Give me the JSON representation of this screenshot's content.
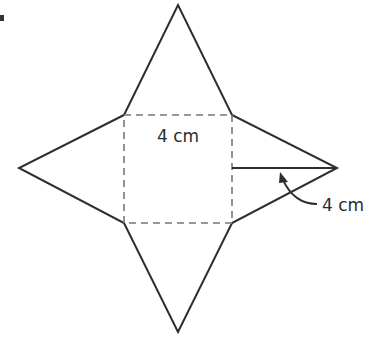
{
  "diagram": {
    "marker": "bullet",
    "base_label": "4 cm",
    "slant_height_label": "4 cm",
    "colors": {
      "stroke": "#2e2e2e",
      "dashed": "#777777",
      "text": "#2b2b2b",
      "background": "#ffffff"
    }
  }
}
